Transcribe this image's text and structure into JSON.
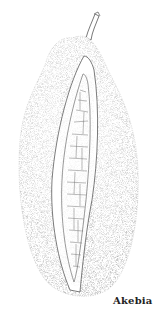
{
  "illustration": {
    "subject": "akebia-fruit",
    "style": "stipple-ink-drawing",
    "ink_color": "#333333",
    "background_color": "#ffffff"
  },
  "caption": {
    "text": "Akebia"
  }
}
